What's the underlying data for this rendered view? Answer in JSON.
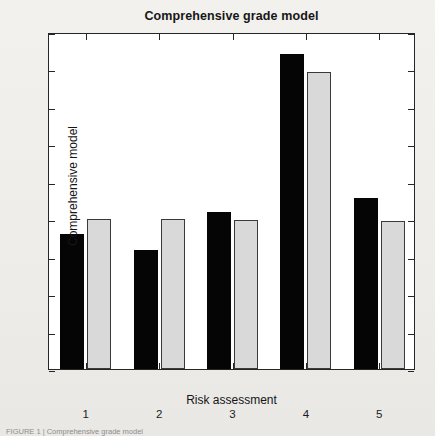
{
  "figure": {
    "caption": "FIGURE 1 | Comprehensive grade model"
  },
  "chart_data": {
    "type": "bar",
    "title": "Comprehensive grade model",
    "xlabel": "Risk assessment",
    "ylabel": "Comprehensive model",
    "categories": [
      "1",
      "2",
      "3",
      "4",
      "5"
    ],
    "series": [
      {
        "name": "series-a",
        "color": "#050505",
        "values": [
          1.8,
          1.59,
          2.1,
          4.2,
          2.28
        ]
      },
      {
        "name": "series-b",
        "color": "#d9d9d9",
        "values": [
          2.0,
          2.0,
          1.99,
          3.97,
          1.97
        ]
      }
    ],
    "ylim": [
      0,
      4.5
    ],
    "ytick_labels": [
      "0",
      "0.5",
      "1",
      "1.5",
      "2",
      "2.5",
      "3",
      "3.5",
      "4",
      "4.5"
    ],
    "ytick_values": [
      0,
      0.5,
      1,
      1.5,
      2,
      2.5,
      3,
      3.5,
      4,
      4.5
    ],
    "grid": false,
    "legend": "none",
    "plot_background": "#ffffff",
    "axis_color": "#262626"
  }
}
